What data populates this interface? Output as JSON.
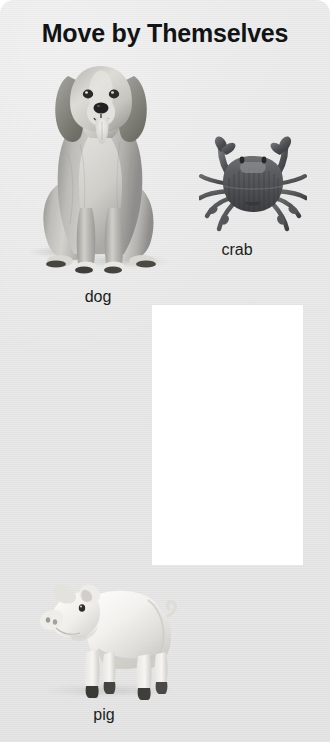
{
  "panel": {
    "title": "Move by Themselves",
    "background_color": "#e5e5e5",
    "title_color": "#111315"
  },
  "items": [
    {
      "id": "dog",
      "label": "dog",
      "icon": "dog-photo",
      "label_x": 98,
      "label_y": 288
    },
    {
      "id": "crab",
      "label": "crab",
      "icon": "crab-photo",
      "label_x": 234,
      "label_y": 241
    },
    {
      "id": "pig",
      "label": "pig",
      "icon": "pig-photo",
      "label_x": 104,
      "label_y": 706
    }
  ],
  "dropzone": {
    "label": "",
    "fill_color": "#ffffff",
    "x": 152,
    "y": 305,
    "width": 151,
    "height": 260
  }
}
